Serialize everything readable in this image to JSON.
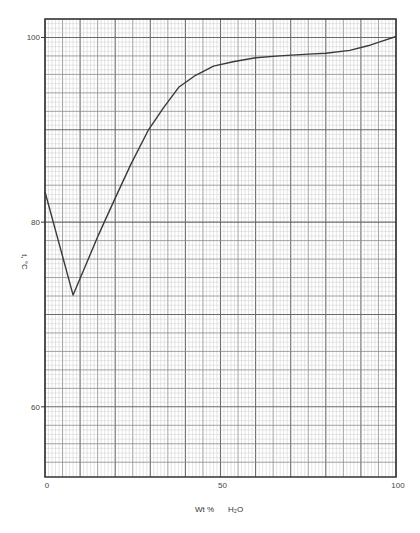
{
  "chart_data": {
    "type": "line",
    "title": "",
    "xlabel": "Wt % H2O",
    "ylabel": "t, °C",
    "xlim": [
      0,
      100
    ],
    "ylim": [
      52.4,
      102
    ],
    "grid": true,
    "x_ticks": [
      0,
      50,
      100
    ],
    "y_ticks": [
      60,
      80,
      100
    ],
    "x_tick_labels": [
      "0",
      "50",
      "100"
    ],
    "y_tick_labels": [
      "60",
      "80",
      "100"
    ],
    "series": [
      {
        "name": "liquidus",
        "x": [
          0,
          8,
          15.2,
          20,
          24.4,
          29.5,
          33.8,
          38.1,
          42.9,
          48,
          53.9,
          60,
          66.8,
          75,
          80,
          86.8,
          92,
          96,
          100
        ],
        "y": [
          83.3,
          72.1,
          78.6,
          82.6,
          86.2,
          90.0,
          92.4,
          94.6,
          95.9,
          96.9,
          97.4,
          97.8,
          98.0,
          98.2,
          98.3,
          98.6,
          99.1,
          99.6,
          100.1
        ]
      }
    ],
    "colors": {
      "line": "#3a3a3a",
      "grid_major": "#6a6a6a",
      "grid_minor": "#bdbdbd",
      "frame": "#333333"
    }
  },
  "labels": {
    "y_axis": "t, °C",
    "x_axis_wt": "Wt %",
    "x_axis_h2o": "H₂O"
  }
}
